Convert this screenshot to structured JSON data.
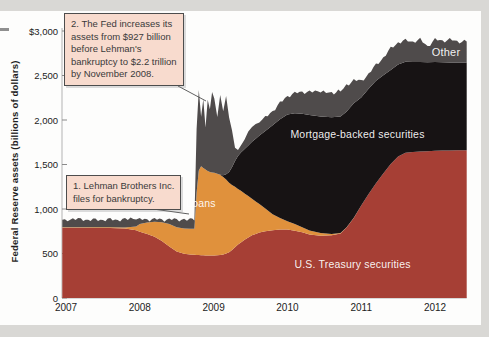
{
  "figure": {
    "y_axis_label": "Federal Reserve assets (billions of dollars)",
    "y_ticks": [
      "$3,000",
      "2,500",
      "2,000",
      "1,500",
      "1,000",
      "500",
      "0"
    ],
    "y_tick_values": [
      3000,
      2500,
      2000,
      1500,
      1000,
      500,
      0
    ],
    "x_ticks": [
      "2007",
      "2008",
      "2009",
      "2010",
      "2011",
      "2012"
    ],
    "x_tick_values": [
      2007,
      2008,
      2009,
      2010,
      2011,
      2012
    ],
    "annotations": [
      {
        "id": "1",
        "text": "1. Lehman Brothers Inc.\nfiles for bankruptcy."
      },
      {
        "id": "2",
        "text": "2. The Fed increases its\nassets from  $927 billion\nbefore Lehman's\nbankruptcy to $2.2 trillion\nby November 2008."
      }
    ]
  },
  "chart_data": {
    "type": "area",
    "stacked": true,
    "title": "",
    "xlabel": "",
    "ylabel": "Federal Reserve assets (billions of dollars)",
    "ylim": [
      0,
      3000
    ],
    "xlim": [
      2006.95,
      2012.43
    ],
    "grid": false,
    "legend_position": "labels-inside-areas",
    "x": [
      2006.95,
      2007.2,
      2007.4,
      2007.6,
      2007.8,
      2007.95,
      2008.0,
      2008.1,
      2008.2,
      2008.3,
      2008.4,
      2008.5,
      2008.6,
      2008.68,
      2008.74,
      2008.77,
      2008.8,
      2008.83,
      2008.86,
      2008.89,
      2008.92,
      2008.95,
      2008.98,
      2009.01,
      2009.05,
      2009.09,
      2009.13,
      2009.17,
      2009.21,
      2009.25,
      2009.29,
      2009.33,
      2009.37,
      2009.42,
      2009.47,
      2009.52,
      2009.57,
      2009.62,
      2009.7,
      2009.8,
      2009.9,
      2010.0,
      2010.1,
      2010.2,
      2010.3,
      2010.45,
      2010.6,
      2010.72,
      2010.8,
      2010.9,
      2011.0,
      2011.1,
      2011.2,
      2011.3,
      2011.4,
      2011.5,
      2011.6,
      2011.7,
      2011.8,
      2011.9,
      2012.0,
      2012.1,
      2012.2,
      2012.3,
      2012.43
    ],
    "series": [
      {
        "name": "U.S. Treasury securities",
        "color": "#a63f35",
        "values": [
          790,
          790,
          788,
          786,
          780,
          762,
          744,
          718,
          688,
          640,
          580,
          522,
          498,
          490,
          486,
          484,
          482,
          480,
          480,
          478,
          478,
          476,
          476,
          478,
          480,
          484,
          490,
          500,
          515,
          540,
          570,
          600,
          625,
          655,
          680,
          705,
          720,
          735,
          750,
          762,
          768,
          768,
          755,
          738,
          715,
          700,
          705,
          725,
          790,
          900,
          1040,
          1170,
          1290,
          1400,
          1505,
          1590,
          1632,
          1640,
          1645,
          1650,
          1655,
          1658,
          1656,
          1660,
          1660
        ]
      },
      {
        "name": "Loans",
        "color": "#e0913c",
        "values": [
          4,
          4,
          6,
          8,
          12,
          40,
          86,
          130,
          168,
          212,
          252,
          272,
          282,
          288,
          292,
          700,
          950,
          1000,
          980,
          965,
          950,
          940,
          935,
          930,
          915,
          900,
          870,
          830,
          780,
          730,
          680,
          625,
          580,
          520,
          465,
          410,
          365,
          320,
          255,
          180,
          130,
          95,
          75,
          58,
          45,
          30,
          14,
          6,
          3,
          1,
          0,
          0,
          0,
          0,
          0,
          0,
          0,
          0,
          0,
          0,
          0,
          0,
          0,
          0,
          0
        ]
      },
      {
        "name": "Mortgage-backed securities",
        "color": "#171314",
        "values": [
          0,
          0,
          0,
          0,
          0,
          0,
          0,
          0,
          0,
          0,
          0,
          0,
          0,
          0,
          0,
          0,
          0,
          0,
          0,
          0,
          0,
          0,
          0,
          0,
          0,
          0,
          20,
          60,
          120,
          200,
          290,
          370,
          430,
          500,
          570,
          640,
          705,
          770,
          870,
          1000,
          1110,
          1200,
          1245,
          1275,
          1295,
          1310,
          1312,
          1308,
          1300,
          1287,
          1212,
          1182,
          1152,
          1102,
          1057,
          1032,
          1022,
          1012,
          1007,
          1000,
          996,
          992,
          991,
          986,
          986
        ]
      },
      {
        "name": "Other",
        "color": "#4f4b4b",
        "values": [
          86,
          88,
          84,
          86,
          88,
          82,
          52,
          36,
          28,
          30,
          50,
          88,
          102,
          104,
          106,
          716,
          898,
          560,
          770,
          467,
          812,
          704,
          884,
          842,
          655,
          891,
          740,
          880,
          620,
          430,
          140,
          85,
          75,
          105,
          145,
          185,
          160,
          145,
          150,
          160,
          180,
          205,
          225,
          245,
          262,
          270,
          272,
          285,
          295,
          265,
          180,
          170,
          172,
          200,
          240,
          250,
          238,
          230,
          250,
          180,
          250,
          242,
          255,
          236,
          236
        ]
      }
    ]
  }
}
